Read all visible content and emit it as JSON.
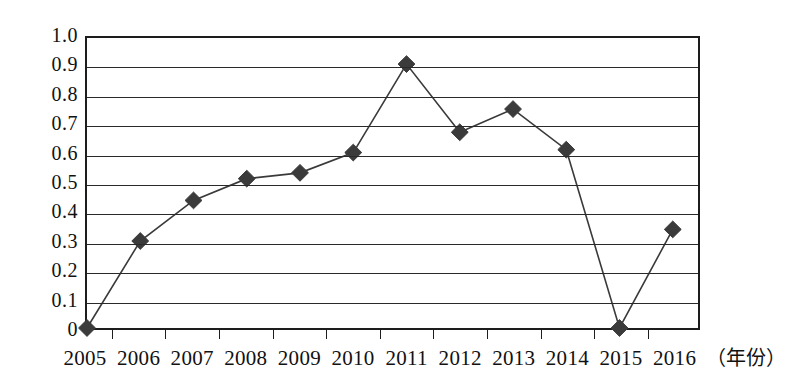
{
  "chart_data": {
    "type": "line",
    "title": "",
    "xlabel": "（年份）",
    "ylabel": "",
    "categories": [
      "2005",
      "2006",
      "2007",
      "2008",
      "2009",
      "2010",
      "2011",
      "2012",
      "2013",
      "2014",
      "2015",
      "2016"
    ],
    "values": [
      0,
      0.3,
      0.44,
      0.515,
      0.535,
      0.605,
      0.91,
      0.675,
      0.755,
      0.615,
      0,
      0.34
    ],
    "series": [
      {
        "name": "series-1",
        "values": [
          0,
          0.3,
          0.44,
          0.515,
          0.535,
          0.605,
          0.91,
          0.675,
          0.755,
          0.615,
          0,
          0.34
        ]
      }
    ],
    "ylim": [
      0,
      1.0
    ],
    "ytick_values": [
      0,
      0.1,
      0.2,
      0.3,
      0.4,
      0.5,
      0.6,
      0.7,
      0.8,
      0.9,
      1.0
    ],
    "ytick_labels": [
      "0",
      "0.1",
      "0.2",
      "0.3",
      "0.4",
      "0.5",
      "0.6",
      "0.7",
      "0.8",
      "0.9",
      "1.0"
    ],
    "grid": "horizontal",
    "legend": "none",
    "marker": "diamond",
    "line_color": "#3a3a3a",
    "marker_color": "#3b3b3b",
    "axis_color": "#1d1d1d",
    "grid_color": "#2a2a2a",
    "background_color": "#ffffff"
  }
}
